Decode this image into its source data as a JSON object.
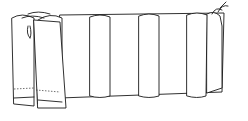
{
  "illustration": {
    "subject": "pleated fabric panel line drawing",
    "colors": {
      "background": "#ffffff",
      "line": "#1a1a1a"
    },
    "pleats": [
      {
        "x": 90,
        "width": 20
      },
      {
        "x": 139,
        "width": 20
      },
      {
        "x": 187,
        "width": 20
      }
    ]
  }
}
